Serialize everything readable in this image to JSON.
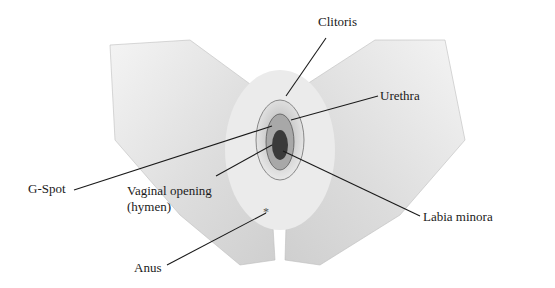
{
  "diagram": {
    "type": "anatomical-illustration",
    "style": "grayscale pencil shading",
    "labels": [
      {
        "id": "clitoris",
        "text": "Clitoris",
        "x": 318,
        "y": 14
      },
      {
        "id": "urethra",
        "text": "Urethra",
        "x": 380,
        "y": 88
      },
      {
        "id": "g-spot",
        "text": "G-Spot",
        "x": 28,
        "y": 181
      },
      {
        "id": "vaginal-opening",
        "text": "Vaginal opening",
        "x": 127,
        "y": 183
      },
      {
        "id": "vaginal-opening-sub",
        "text": "(hymen)",
        "x": 127,
        "y": 199
      },
      {
        "id": "labia-minora",
        "text": "Labia minora",
        "x": 423,
        "y": 209
      },
      {
        "id": "anus",
        "text": "Anus",
        "x": 134,
        "y": 260
      }
    ],
    "leaders": [
      {
        "for": "clitoris",
        "x1": 326,
        "y1": 38,
        "x2": 286,
        "y2": 96
      },
      {
        "for": "urethra",
        "x1": 378,
        "y1": 96,
        "x2": 291,
        "y2": 120
      },
      {
        "for": "g-spot",
        "x1": 74,
        "y1": 190,
        "x2": 272,
        "y2": 126
      },
      {
        "for": "vaginal-opening",
        "x1": 216,
        "y1": 176,
        "x2": 272,
        "y2": 145
      },
      {
        "for": "labia-minora",
        "x1": 420,
        "y1": 216,
        "x2": 283,
        "y2": 151
      },
      {
        "for": "anus",
        "x1": 167,
        "y1": 265,
        "x2": 266,
        "y2": 213
      }
    ],
    "colors": {
      "ink": "#1a1a1a",
      "shade_light": "#ececec",
      "shade_mid": "#c9c9c9",
      "shade_dark": "#3a3a3a"
    }
  }
}
